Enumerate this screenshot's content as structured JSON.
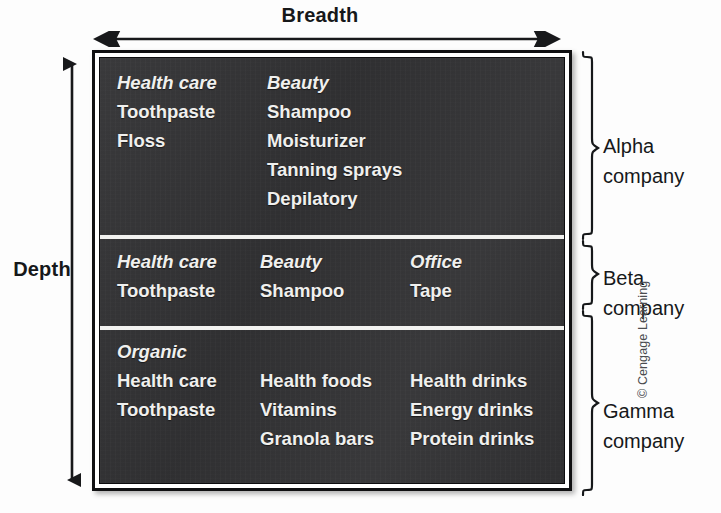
{
  "diagram": {
    "breadth_label": "Breadth",
    "depth_label": "Depth",
    "copyright": "© Cengage Learning"
  },
  "bands": [
    {
      "id": "alpha",
      "company_name": "Alpha",
      "company_suffix": "company",
      "columns": [
        {
          "category": "Health care",
          "items": [
            "Toothpaste",
            "Floss"
          ]
        },
        {
          "category": "Beauty",
          "items": [
            "Shampoo",
            "Moisturizer",
            "Tanning sprays",
            "Depilatory"
          ]
        }
      ]
    },
    {
      "id": "beta",
      "company_name": "Beta",
      "company_suffix": "company",
      "columns": [
        {
          "category": "Health care",
          "items": [
            "Toothpaste"
          ]
        },
        {
          "category": "Beauty",
          "items": [
            "Shampoo"
          ]
        },
        {
          "category": "Office",
          "items": [
            "Tape"
          ]
        }
      ]
    },
    {
      "id": "gamma",
      "company_name": "Gamma",
      "company_suffix": "company",
      "organic_label": "Organic",
      "columns": [
        {
          "heading": "Health care",
          "items": [
            "Toothpaste"
          ]
        },
        {
          "heading": "Health foods",
          "items": [
            "Vitamins",
            "Granola bars"
          ]
        },
        {
          "heading": "Health drinks",
          "items": [
            "Energy drinks",
            "Protein drinks"
          ]
        }
      ]
    }
  ],
  "colors": {
    "matrix_background": "#323234",
    "matrix_border": "#101012",
    "text_on_dark": "#f0f0ee",
    "divider": "#f2f2f0",
    "label_text": "#16181a"
  }
}
